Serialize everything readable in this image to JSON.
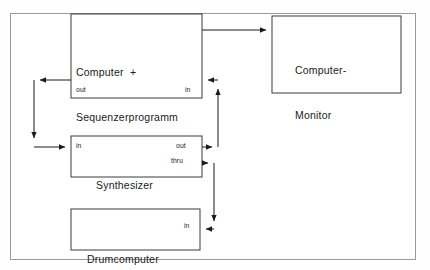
{
  "diagram": {
    "background_color": "#ffffff",
    "frame_color": "#9a9a9a",
    "line_color": "#1a1a1a",
    "nodes": [
      {
        "id": "computer",
        "label_line1": "Computer  +",
        "label_line2": "Sequenzerprogramm",
        "ports": [
          {
            "id": "computer-out",
            "label": "out"
          },
          {
            "id": "computer-in",
            "label": "in"
          }
        ]
      },
      {
        "id": "monitor",
        "label_line1": "Computer-",
        "label_line2": "Monitor",
        "ports": []
      },
      {
        "id": "synthesizer",
        "label_line1": "Synthesizer",
        "label_line2": "",
        "ports": [
          {
            "id": "synth-in",
            "label": "in"
          },
          {
            "id": "synth-out",
            "label": "out"
          },
          {
            "id": "synth-thru",
            "label": "thru"
          }
        ]
      },
      {
        "id": "drumcomputer",
        "label_line1": "Drumcomputer",
        "label_line2": "",
        "ports": [
          {
            "id": "drum-in",
            "label": "in"
          }
        ]
      }
    ],
    "connections": [
      {
        "id": "computer-to-monitor",
        "from": "computer",
        "to": "monitor"
      },
      {
        "id": "computer-out-to-synth-in",
        "from": "computer-out",
        "to": "synth-in"
      },
      {
        "id": "synth-out-to-computer-in",
        "from": "synth-out",
        "to": "computer-in"
      },
      {
        "id": "synth-thru-to-drum-in",
        "from": "synth-thru",
        "to": "drum-in"
      }
    ]
  }
}
